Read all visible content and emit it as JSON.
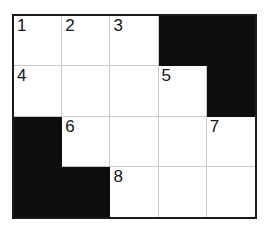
{
  "puzzle": {
    "title": "Crossword Grid",
    "type": "crossword",
    "columns": 5,
    "rows": 4,
    "colors": {
      "block": "#0d0d0d",
      "open": "#ffffff",
      "grid_line": "#c9c9c9",
      "border": "#1a1a1a",
      "number_text": "#151515",
      "page_background": "#ffffff"
    },
    "cells": [
      {
        "row": 1,
        "col": 1,
        "block": false,
        "number": "1"
      },
      {
        "row": 1,
        "col": 2,
        "block": false,
        "number": "2"
      },
      {
        "row": 1,
        "col": 3,
        "block": false,
        "number": "3"
      },
      {
        "row": 1,
        "col": 4,
        "block": true,
        "number": ""
      },
      {
        "row": 1,
        "col": 5,
        "block": true,
        "number": ""
      },
      {
        "row": 2,
        "col": 1,
        "block": false,
        "number": "4"
      },
      {
        "row": 2,
        "col": 2,
        "block": false,
        "number": ""
      },
      {
        "row": 2,
        "col": 3,
        "block": false,
        "number": ""
      },
      {
        "row": 2,
        "col": 4,
        "block": false,
        "number": "5"
      },
      {
        "row": 2,
        "col": 5,
        "block": true,
        "number": ""
      },
      {
        "row": 3,
        "col": 1,
        "block": true,
        "number": ""
      },
      {
        "row": 3,
        "col": 2,
        "block": false,
        "number": "6"
      },
      {
        "row": 3,
        "col": 3,
        "block": false,
        "number": ""
      },
      {
        "row": 3,
        "col": 4,
        "block": false,
        "number": ""
      },
      {
        "row": 3,
        "col": 5,
        "block": false,
        "number": "7"
      },
      {
        "row": 4,
        "col": 1,
        "block": true,
        "number": ""
      },
      {
        "row": 4,
        "col": 2,
        "block": true,
        "number": ""
      },
      {
        "row": 4,
        "col": 3,
        "block": false,
        "number": "8"
      },
      {
        "row": 4,
        "col": 4,
        "block": false,
        "number": ""
      },
      {
        "row": 4,
        "col": 5,
        "block": false,
        "number": ""
      }
    ]
  }
}
